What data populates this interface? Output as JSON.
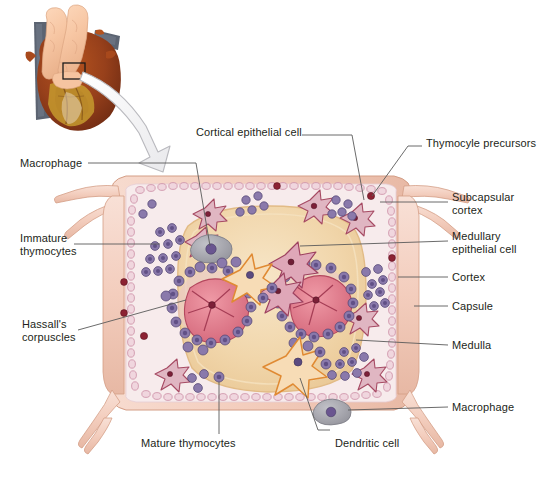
{
  "figure": {
    "type": "anatomical-diagram",
    "inset": {
      "name": "heart-and-thymus-photograph",
      "description": "Anterior view of heart with thymus lobes superior, callout box on thymus",
      "callout_box": "black rectangle outline",
      "arrow": "curved white arrow from callout box to magnified diagram"
    },
    "colors": {
      "capsule": "#f3cdbd",
      "capsule_edge": "#d9a68f",
      "cortex": "#f7ebec",
      "medulla": "#f1d6ab",
      "medulla_edge": "#e2bb86",
      "subcapsular_chain": "#e3b7c6",
      "epithelial_cell": "#b5566f",
      "dendritic_cell": "#e8943c",
      "thymocyte": "#7b6a9e",
      "macrophage": "#a8a8ae",
      "hassall_corpuscle": "#d9707f",
      "precursor": "#8c2233",
      "leader_line": "#5a5a5a",
      "text": "#231f20"
    }
  },
  "labels": {
    "top": [
      {
        "id": "cortical-epithelial-cell",
        "text": "Cortical epithelial cell",
        "x": 196,
        "y": 131,
        "side": "left"
      },
      {
        "id": "thymocyte-precursors",
        "text": "Thymocyle precursors",
        "x": 426,
        "y": 142,
        "side": "right"
      }
    ],
    "left": [
      {
        "id": "macrophage-top",
        "text": "Macrophage",
        "x": 20,
        "y": 159,
        "side": "left"
      },
      {
        "id": "immature-thymocytes",
        "text": "Immature\nthymocytes",
        "x": 20,
        "y": 232,
        "side": "left"
      },
      {
        "id": "hassalls-corpuscles",
        "text": "Hassall's\ncorpuscles",
        "x": 22,
        "y": 318,
        "side": "left"
      }
    ],
    "right": [
      {
        "id": "subcapsular-cortex",
        "text": "Subcapsular\ncortex",
        "x": 452,
        "y": 197,
        "side": "right"
      },
      {
        "id": "medullary-epithelial-cell",
        "text": "Medullary\nepithelial cell",
        "x": 452,
        "y": 236,
        "side": "right"
      },
      {
        "id": "cortex",
        "text": "Cortex",
        "x": 452,
        "y": 272,
        "side": "right"
      },
      {
        "id": "capsule",
        "text": "Capsule",
        "x": 452,
        "y": 301,
        "side": "right"
      },
      {
        "id": "medulla",
        "text": "Medulla",
        "x": 452,
        "y": 340,
        "side": "right"
      },
      {
        "id": "macrophage-bottom",
        "text": "Macrophage",
        "x": 452,
        "y": 402,
        "side": "right"
      }
    ],
    "bottom": [
      {
        "id": "mature-thymocytes",
        "text": "Mature thymocytes",
        "x": 171,
        "y": 443,
        "side": "bottom"
      },
      {
        "id": "dendritic-cell",
        "text": "Dendritic cell",
        "x": 335,
        "y": 443,
        "side": "bottom"
      }
    ]
  },
  "structures": [
    {
      "id": "capsule",
      "label": "Capsule"
    },
    {
      "id": "subcapsular-cortex",
      "label": "Subcapsular cortex"
    },
    {
      "id": "cortex",
      "label": "Cortex"
    },
    {
      "id": "medulla",
      "label": "Medulla"
    },
    {
      "id": "hassalls-corpuscle",
      "label": "Hassall's corpuscle",
      "count": 2
    },
    {
      "id": "dendritic-cell",
      "label": "Dendritic cell",
      "count": 3
    },
    {
      "id": "medullary-epithelial-cell",
      "label": "Medullary epithelial cell",
      "count": 3
    },
    {
      "id": "cortical-epithelial-cell",
      "label": "Cortical epithelial cell",
      "count": 6
    },
    {
      "id": "macrophage",
      "label": "Macrophage",
      "count": 2
    },
    {
      "id": "thymocyte-precursor",
      "label": "Thymocyte precursor",
      "count": 5
    }
  ]
}
